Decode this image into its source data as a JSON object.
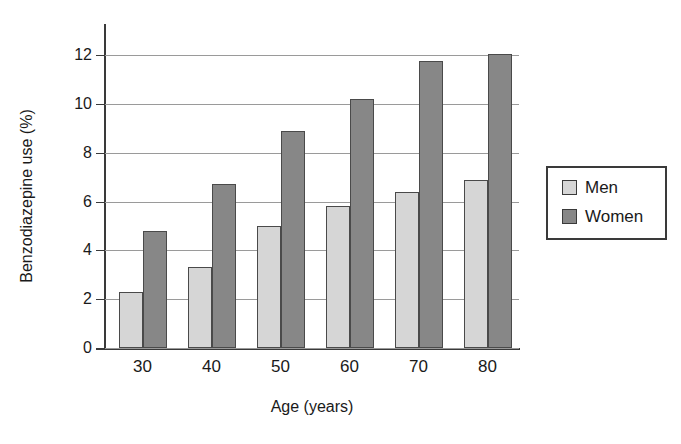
{
  "chart_data": {
    "type": "bar",
    "title": "",
    "subtitle": "",
    "xlabel": "Age (years)",
    "ylabel": "Benzodiazepine use (%)",
    "categories": [
      "30",
      "40",
      "50",
      "60",
      "70",
      "80"
    ],
    "series": [
      {
        "name": "Men",
        "color": "#d6d6d6",
        "values": [
          2.3,
          3.3,
          5.0,
          5.8,
          6.4,
          6.9
        ]
      },
      {
        "name": "Women",
        "color": "#878787",
        "values": [
          4.8,
          6.7,
          8.9,
          10.2,
          11.75,
          12.05
        ]
      }
    ],
    "ylim": [
      0,
      12
    ],
    "ytick_labels": [
      "12",
      "10",
      "8",
      "6",
      "4",
      "2",
      "0"
    ],
    "ytick_values": [
      12,
      10,
      8,
      6,
      4,
      2,
      0
    ],
    "xtick_labels": [
      "30",
      "40",
      "50",
      "60",
      "70",
      "80"
    ],
    "grid": "horizontal",
    "legend_position": "right-outside",
    "legend_entries": [
      "Men",
      "Women"
    ]
  },
  "axes": {
    "y_title": "Benzodiazepine use (%)",
    "x_title": "Age (years)"
  },
  "legend": {
    "men_label": "Men",
    "women_label": "Women"
  }
}
